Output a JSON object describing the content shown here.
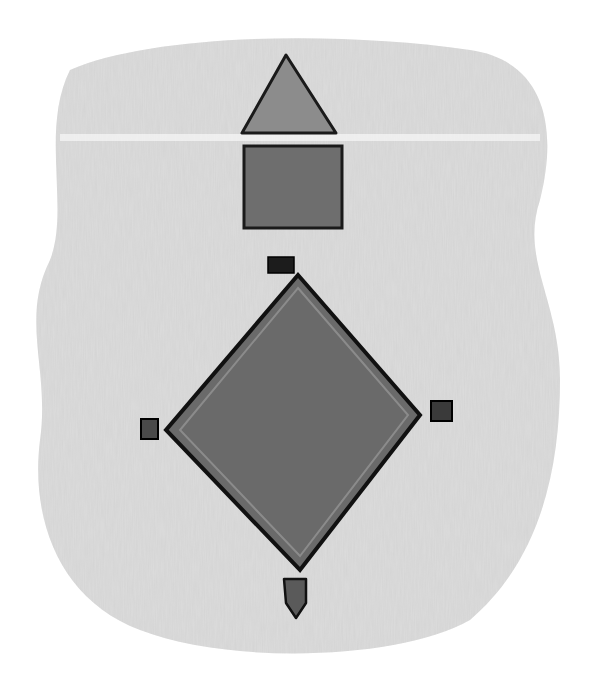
{
  "drawing": {
    "medium": "pencil sketch",
    "background_color": "#ffffff",
    "shading_color": "#d9d9d9",
    "outline_color": "#111111",
    "fill_dark": "#6a6a6a",
    "fill_mid": "#8a8a8a",
    "elements": {
      "roof_triangle": {
        "points": "286,55 242,133 336,133"
      },
      "house_box": {
        "x": 244,
        "y": 146,
        "width": 98,
        "height": 82
      },
      "diamond": {
        "points": "298,275 420,415 300,570 166,430"
      },
      "second_base": {
        "x": 268,
        "y": 257,
        "width": 26,
        "height": 16
      },
      "first_base": {
        "x": 431,
        "y": 401,
        "width": 21,
        "height": 20
      },
      "third_base": {
        "x": 141,
        "y": 419,
        "width": 17,
        "height": 20
      },
      "home_plate": {
        "points": "284,579 306,579 306,603 296,618 286,603"
      }
    }
  }
}
